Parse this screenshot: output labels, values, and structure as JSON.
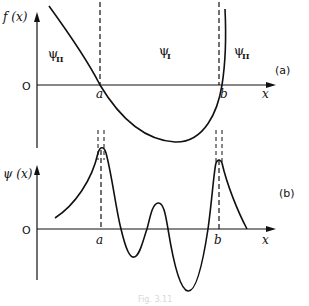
{
  "figure": {
    "caption": "Fig. 3.11",
    "panel_a": {
      "tag": "(a)",
      "y_axis_label": "f (x)",
      "x_axis_label": "x",
      "origin_label": "O",
      "turning_points": [
        "a",
        "b"
      ],
      "regions": [
        {
          "symbol": "ψ",
          "subscript": "II",
          "position": "left"
        },
        {
          "symbol": "ψ",
          "subscript": "I",
          "position": "middle"
        },
        {
          "symbol": "ψ",
          "subscript": "II",
          "position": "right"
        }
      ]
    },
    "panel_b": {
      "tag": "(b)",
      "y_axis_label": "ψ (x)",
      "x_axis_label": "x",
      "origin_label": "O",
      "turning_points": [
        "a",
        "b"
      ]
    }
  },
  "colors": {
    "ink": "#111111",
    "background": "#ffffff"
  }
}
